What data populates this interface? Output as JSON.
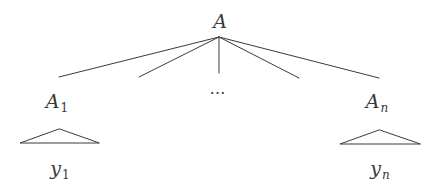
{
  "diagram": {
    "type": "tree",
    "root": {
      "label": "A"
    },
    "ellipsis": "…",
    "children": [
      {
        "label": "A",
        "subscript": "1",
        "yield": {
          "label": "y",
          "subscript": "1"
        }
      },
      {
        "label": "A",
        "subscript": "n",
        "yield": {
          "label": "y",
          "subscript": "n"
        }
      }
    ],
    "edge_count": 5,
    "line_color": "#3a3a3a",
    "background": "#ffffff"
  }
}
